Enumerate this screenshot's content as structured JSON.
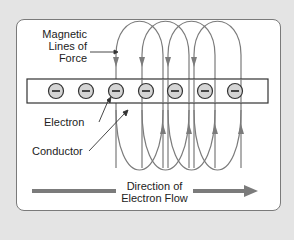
{
  "diagram": {
    "labels": {
      "magnetic": [
        "Magnetic",
        "Lines of",
        "Force"
      ],
      "electron": "Electron",
      "conductor": "Conductor",
      "flow": [
        "Direction of",
        "Electron Flow"
      ]
    },
    "electrons": [
      {
        "cx": 56,
        "sign": "−"
      },
      {
        "cx": 86,
        "sign": "−"
      },
      {
        "cx": 116,
        "sign": "−"
      },
      {
        "cx": 146,
        "sign": "−"
      },
      {
        "cx": 175,
        "sign": "−"
      },
      {
        "cx": 205,
        "sign": "−"
      },
      {
        "cx": 235,
        "sign": "−"
      }
    ],
    "colors": {
      "background": "#e4e4e4",
      "panel": "#ffffff",
      "line": "#7b7b7b",
      "electron_fill": "#d4d4d4",
      "text": "#222222"
    }
  }
}
